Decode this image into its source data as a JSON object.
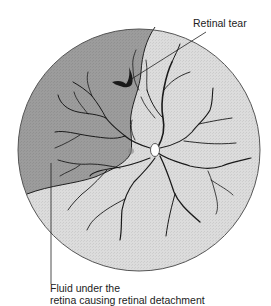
{
  "figure": {
    "background_color": "#ffffff",
    "attached_retina_color": "#dcdcdc",
    "detached_retina_color": "#9c9c9c",
    "vessel_color": "#1a1a1a",
    "outline_color": "#555555"
  },
  "labels": {
    "retinal_tear": "Retinal tear",
    "fluid_line1": "Fluid under the",
    "fluid_line2": "retina causing retinal detachment"
  },
  "structures": [
    {
      "name": "fundus",
      "shape": "circle",
      "cx": 139,
      "cy": 150,
      "r": 121
    },
    {
      "name": "optic-disc",
      "cx": 155,
      "cy": 150
    },
    {
      "name": "macula",
      "cx": 131,
      "cy": 151
    },
    {
      "name": "retinal-tear",
      "cx": 123,
      "cy": 80
    },
    {
      "name": "detached-region",
      "location": "upper-left"
    }
  ]
}
